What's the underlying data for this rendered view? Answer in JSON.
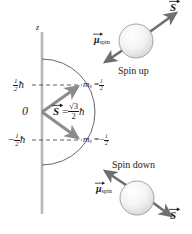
{
  "figure": {
    "axis": {
      "label": "z"
    },
    "ticks": {
      "upper": {
        "value": "½ħ",
        "number_num": "1",
        "number_den": "2",
        "symbol": "ħ"
      },
      "zero": {
        "label": "0"
      },
      "lower": {
        "value": "-½ħ",
        "sign": "−",
        "number_num": "1",
        "number_den": "2",
        "symbol": "ħ"
      }
    },
    "magnitude": {
      "vector_symbol": "S",
      "equals": "=",
      "numerator": "√3",
      "denominator": "2",
      "hbar": "ħ"
    },
    "quantum_numbers": {
      "up": {
        "symbol": "m",
        "subscript": "s",
        "equals": "=",
        "num": "1",
        "den": "2",
        "sign": ""
      },
      "down": {
        "symbol": "m",
        "subscript": "s",
        "equals": "=",
        "num": "1",
        "den": "2",
        "sign": "−"
      }
    },
    "states": {
      "up": {
        "caption": "Spin up",
        "moment_symbol": "μ",
        "moment_subscript": "spin",
        "spin_symbol": "S"
      },
      "down": {
        "caption": "Spin down",
        "moment_symbol": "μ",
        "moment_subscript": "spin",
        "spin_symbol": "S"
      }
    },
    "colors": {
      "axis": "#b0b0b0",
      "vector": "#8c8c8c",
      "arc": "#555555",
      "dashed": "#555555",
      "arrow": "#6e6e6e",
      "sphere_outline": "#9a9a9a",
      "sphere_fill": "#f2f2f2",
      "text": "#1a1a1a"
    }
  }
}
